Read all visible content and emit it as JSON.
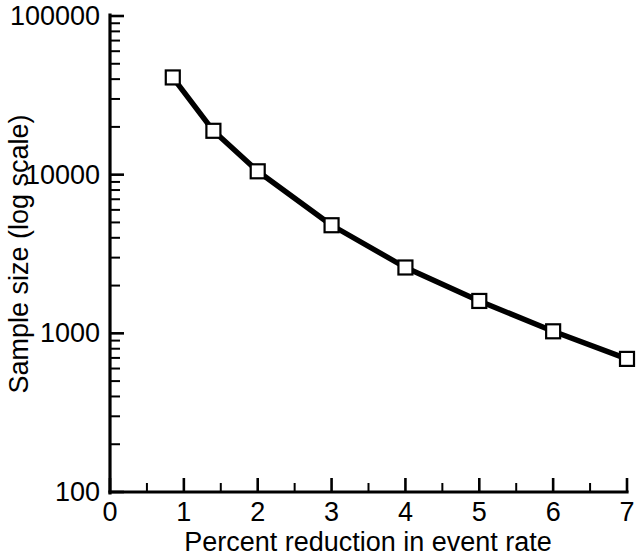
{
  "chart_data": {
    "type": "line",
    "title": "",
    "xlabel": "Percent reduction in event rate",
    "ylabel": "Sample size (log scale)",
    "yscale": "log",
    "xscale": "linear",
    "xlim": [
      0,
      7
    ],
    "ylim": [
      100,
      100000
    ],
    "grid": false,
    "legend": null,
    "marker": "open-square",
    "line_color": "#000000",
    "marker_face_color": "#ffffff",
    "marker_edge_color": "#000000",
    "x": [
      0.85,
      1.4,
      2.0,
      3.0,
      4.0,
      5.0,
      6.0,
      7.0
    ],
    "values": [
      41000,
      18900,
      10500,
      4800,
      2600,
      1600,
      1030,
      690
    ],
    "series": [
      {
        "name": "Sample size",
        "x": [
          0.85,
          1.4,
          2.0,
          3.0,
          4.0,
          5.0,
          6.0,
          7.0
        ],
        "values": [
          41000,
          18900,
          10500,
          4800,
          2600,
          1600,
          1030,
          690
        ]
      }
    ],
    "x_ticks": [
      0,
      1,
      2,
      3,
      4,
      5,
      6,
      7
    ],
    "x_tick_labels": [
      "0",
      "1",
      "2",
      "3",
      "4",
      "5",
      "6",
      "7"
    ],
    "x_minor_ticks": [
      0.5,
      1.5,
      2.5,
      3.5,
      4.5,
      5.5,
      6.5
    ],
    "y_ticks": [
      100,
      1000,
      10000,
      100000
    ],
    "y_tick_labels": [
      "100",
      "1000",
      "10000",
      "100000"
    ]
  }
}
